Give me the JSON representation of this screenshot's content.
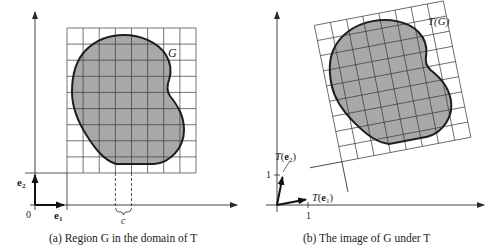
{
  "panels": [
    {
      "id": "a",
      "caption": "(a) Region G in the domain of T",
      "region_label": "G",
      "basis_labels": {
        "e1": "e₁",
        "e2": "e₂"
      },
      "origin_label": "0",
      "cell_label": "c"
    },
    {
      "id": "b",
      "caption": "(b) The image of G under T",
      "region_label": "T(G)",
      "basis_labels": {
        "Te1": "T(e₁)",
        "Te2": "T(e₂)"
      },
      "tick_x": "1",
      "tick_y": "1"
    }
  ],
  "colors": {
    "region_fill": "#a8a8a8",
    "line": "#2a2a2a",
    "grid": "#3a3a3a",
    "background": "#ffffff"
  }
}
